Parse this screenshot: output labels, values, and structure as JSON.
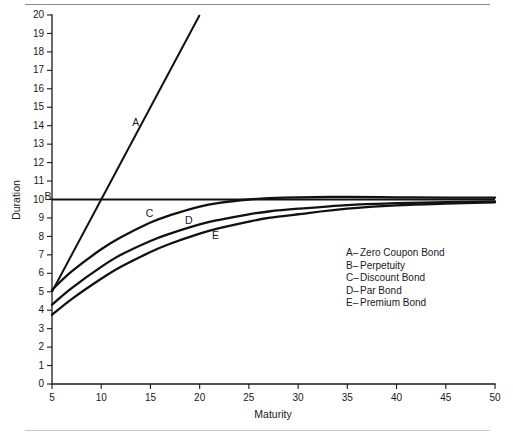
{
  "figure": {
    "rule_top": true,
    "rule_bottom": true
  },
  "chart_data": {
    "type": "line",
    "title": "",
    "xlabel": "Maturity",
    "ylabel": "Duration",
    "xlim": [
      5,
      50
    ],
    "ylim": [
      0,
      20
    ],
    "xticks": [
      5,
      10,
      15,
      20,
      25,
      30,
      35,
      40,
      45,
      50
    ],
    "yticks": [
      0,
      1,
      2,
      3,
      4,
      5,
      6,
      7,
      8,
      9,
      10,
      11,
      12,
      13,
      14,
      15,
      16,
      17,
      18,
      19,
      20
    ],
    "grid": false,
    "legend_position": "inside-right-lower",
    "series": [
      {
        "key": "A",
        "name": "Zero Coupon Bond",
        "label_x": 13.5,
        "label_y": 14.0,
        "x": [
          5,
          10,
          15,
          20
        ],
        "values": [
          5.0,
          10.0,
          15.0,
          20.0
        ]
      },
      {
        "key": "B",
        "name": "Perpetuity",
        "label_x": 4.6,
        "label_y": 10.0,
        "x": [
          5,
          50
        ],
        "values": [
          10.0,
          10.0
        ]
      },
      {
        "key": "C",
        "name": "Discount Bond",
        "label_x": 14.9,
        "label_y": 9.05,
        "x": [
          5,
          7,
          10,
          12,
          15,
          17,
          20,
          22,
          25,
          27,
          30,
          35,
          40,
          45,
          50
        ],
        "values": [
          5.1,
          6.1,
          7.3,
          7.95,
          8.75,
          9.15,
          9.62,
          9.82,
          10.0,
          10.07,
          10.12,
          10.14,
          10.12,
          10.1,
          10.1
        ]
      },
      {
        "key": "D",
        "name": "Par Bond",
        "label_x": 18.9,
        "label_y": 8.65,
        "x": [
          5,
          7,
          10,
          12,
          15,
          17,
          20,
          22,
          25,
          27,
          30,
          35,
          40,
          45,
          50
        ],
        "values": [
          4.3,
          5.2,
          6.35,
          7.0,
          7.75,
          8.15,
          8.65,
          8.9,
          9.2,
          9.35,
          9.5,
          9.7,
          9.8,
          9.86,
          9.9
        ]
      },
      {
        "key": "E",
        "name": "Premium Bond",
        "label_x": 21.6,
        "label_y": 7.85,
        "x": [
          5,
          7,
          10,
          12,
          15,
          17,
          20,
          22,
          25,
          27,
          30,
          35,
          40,
          45,
          50
        ],
        "values": [
          3.75,
          4.6,
          5.7,
          6.35,
          7.15,
          7.6,
          8.15,
          8.45,
          8.8,
          9.0,
          9.2,
          9.5,
          9.68,
          9.78,
          9.85
        ]
      }
    ],
    "legend_entries": [
      {
        "marker": "A–",
        "text": "Zero Coupon Bond"
      },
      {
        "marker": "B–",
        "text": "Perpetuity"
      },
      {
        "marker": "C–",
        "text": "Discount Bond"
      },
      {
        "marker": "D–",
        "text": "Par Bond"
      },
      {
        "marker": "E–",
        "text": "Premium Bond"
      }
    ],
    "legend_x": 346,
    "legend_y": 256,
    "legend_line_height": 12.6,
    "colors": {
      "curve": "#111111",
      "axis": "#1a1a1a",
      "text": "#1a1a1a",
      "rule_top": "#8b8b8b",
      "rule_bottom": "#c9c9c9"
    }
  }
}
